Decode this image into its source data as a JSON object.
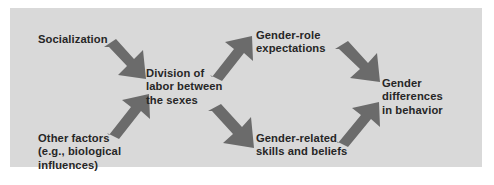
{
  "diagram": {
    "background_color": "#d9d9d9",
    "page_color": "#ffffff",
    "arrow_color": "#6b6b6b",
    "text_color": "#262626",
    "nodes": [
      {
        "id": "socialization",
        "label": "Socialization"
      },
      {
        "id": "other_factors",
        "label": "Other factors\n(e.g., biological\ninfluences)"
      },
      {
        "id": "division_of_labor",
        "label": "Division of\nlabor between\nthe sexes"
      },
      {
        "id": "gender_role",
        "label": "Gender-role\nexpectations"
      },
      {
        "id": "gender_skills",
        "label": "Gender-related\nskills and beliefs"
      },
      {
        "id": "gender_differences",
        "label": "Gender differences\nin behavior"
      }
    ],
    "arrows": [
      {
        "id": "socialization_to_division",
        "from": "socialization",
        "to": "division_of_labor",
        "direction": "down-right"
      },
      {
        "id": "other_to_division",
        "from": "other_factors",
        "to": "division_of_labor",
        "direction": "up-right"
      },
      {
        "id": "division_to_role",
        "from": "division_of_labor",
        "to": "gender_role",
        "direction": "up-right"
      },
      {
        "id": "division_to_skills",
        "from": "division_of_labor",
        "to": "gender_skills",
        "direction": "down-right"
      },
      {
        "id": "role_to_differences",
        "from": "gender_role",
        "to": "gender_differences",
        "direction": "down-right"
      },
      {
        "id": "skills_to_differences",
        "from": "gender_skills",
        "to": "gender_differences",
        "direction": "up-right"
      }
    ]
  }
}
